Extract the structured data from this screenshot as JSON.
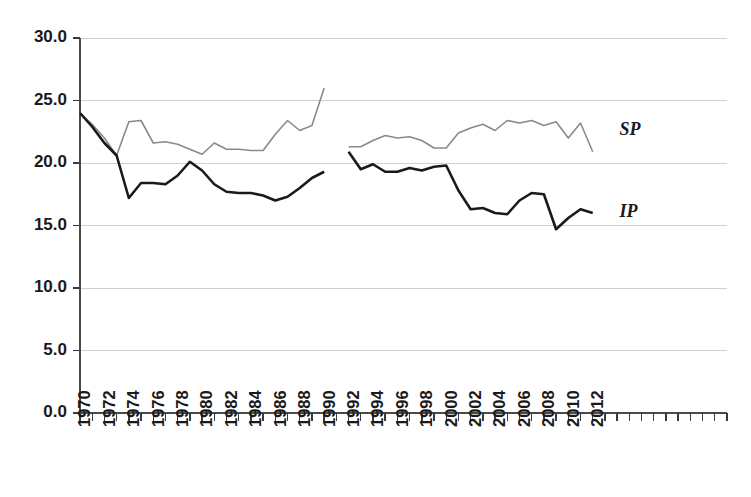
{
  "chart_data": {
    "type": "line",
    "title": "",
    "subtitle": "",
    "xlabel": "",
    "ylabel": "",
    "ylim": [
      0.0,
      30.0
    ],
    "ytick_values": [
      0.0,
      5.0,
      10.0,
      15.0,
      20.0,
      25.0,
      30.0
    ],
    "ytick_labels": [
      "0.0",
      "5.0",
      "10.0",
      "15.0",
      "20.0",
      "25.0",
      "30.0"
    ],
    "xlim": [
      1970,
      2023
    ],
    "xtick_years": [
      1970,
      1971,
      1972,
      1973,
      1974,
      1975,
      1976,
      1977,
      1978,
      1979,
      1980,
      1981,
      1982,
      1983,
      1984,
      1985,
      1986,
      1987,
      1988,
      1989,
      1990,
      1991,
      1992,
      1993,
      1994,
      1995,
      1996,
      1997,
      1998,
      1999,
      2000,
      2001,
      2002,
      2003,
      2004,
      2005,
      2006,
      2007,
      2008,
      2009,
      2010,
      2011,
      2012,
      2013,
      2014,
      2015,
      2016,
      2017,
      2018,
      2019,
      2020,
      2021,
      2022,
      2023
    ],
    "xtick_labels": [
      "1970",
      "1972",
      "1974",
      "1976",
      "1978",
      "1980",
      "1982",
      "1984",
      "1986",
      "1988",
      "1990",
      "1992",
      "1994",
      "1996",
      "1998",
      "2000",
      "2002",
      "2004",
      "2006",
      "2008",
      "2010",
      "2012"
    ],
    "xtick_label_years": [
      1970,
      1972,
      1974,
      1976,
      1978,
      1980,
      1982,
      1984,
      1986,
      1988,
      1990,
      1992,
      1994,
      1996,
      1998,
      2000,
      2002,
      2004,
      2006,
      2008,
      2010,
      2012
    ],
    "grid": "horizontal",
    "legend_position": "inline-right",
    "series": [
      {
        "name": "SP",
        "label": "SP",
        "color": "#8a8a8a",
        "stroke_width": 1.6,
        "label_x_year": 2014.2,
        "label_y_value": 22.6,
        "segments": [
          {
            "x": [
              1970,
              1971,
              1972,
              1973,
              1974,
              1975,
              1976,
              1977,
              1978,
              1979,
              1980,
              1981,
              1982,
              1983,
              1984,
              1985,
              1986,
              1987,
              1988,
              1989,
              1990
            ],
            "y": [
              24.0,
              23.1,
              22.0,
              20.6,
              23.3,
              23.4,
              21.6,
              21.7,
              21.5,
              21.1,
              20.7,
              21.6,
              21.1,
              21.1,
              21.0,
              21.0,
              22.3,
              23.4,
              22.6,
              23.0,
              26.0
            ]
          },
          {
            "x": [
              1992,
              1993,
              1994,
              1995,
              1996,
              1997,
              1998,
              1999,
              2000,
              2001,
              2002,
              2003,
              2004,
              2005,
              2006,
              2007,
              2008,
              2009,
              2010,
              2011,
              2012
            ],
            "y": [
              21.3,
              21.3,
              21.8,
              22.2,
              22.0,
              22.1,
              21.8,
              21.2,
              21.2,
              22.4,
              22.8,
              23.1,
              22.6,
              23.4,
              23.2,
              23.4,
              23.0,
              23.3,
              22.0,
              23.2,
              20.9
            ]
          }
        ]
      },
      {
        "name": "IP",
        "label": "IP",
        "color": "#1a1a1a",
        "stroke_width": 2.6,
        "label_x_year": 2014.2,
        "label_y_value": 16.0,
        "segments": [
          {
            "x": [
              1970,
              1971,
              1972,
              1973,
              1974,
              1975,
              1976,
              1977,
              1978,
              1979,
              1980,
              1981,
              1982,
              1983,
              1984,
              1985,
              1986,
              1987,
              1988,
              1989,
              1990
            ],
            "y": [
              24.0,
              22.9,
              21.6,
              20.6,
              17.2,
              18.4,
              18.4,
              18.3,
              19.0,
              20.1,
              19.4,
              18.3,
              17.7,
              17.6,
              17.6,
              17.4,
              17.0,
              17.3,
              18.0,
              18.8,
              19.3
            ]
          },
          {
            "x": [
              1992,
              1993,
              1994,
              1995,
              1996,
              1997,
              1998,
              1999,
              2000,
              2001,
              2002,
              2003,
              2004,
              2005,
              2006,
              2007,
              2008,
              2009,
              2010,
              2011,
              2012
            ],
            "y": [
              20.9,
              19.5,
              19.9,
              19.3,
              19.3,
              19.6,
              19.4,
              19.7,
              19.8,
              17.8,
              16.3,
              16.4,
              16.0,
              15.9,
              17.0,
              17.6,
              17.5,
              14.7,
              15.6,
              16.3,
              16.0
            ]
          }
        ]
      }
    ]
  },
  "geometry": {
    "plot_left": 80,
    "plot_right": 727,
    "plot_top": 38,
    "plot_bottom": 413,
    "x_start_year": 1970,
    "x_end_year": 2023
  }
}
